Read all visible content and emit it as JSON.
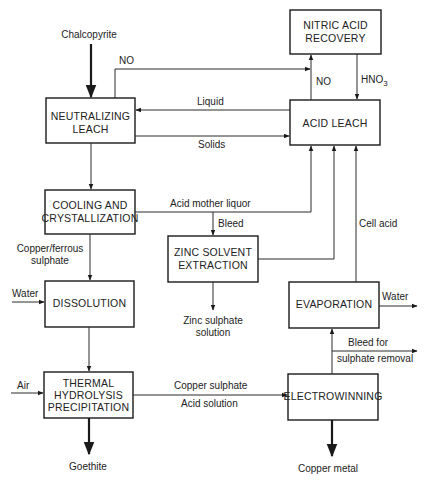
{
  "diagram": {
    "type": "process-flowsheet",
    "units": {
      "nitric_acid_recovery": [
        "NITRIC ACID",
        "RECOVERY"
      ],
      "neutralizing_leach": [
        "NEUTRALIZING",
        "LEACH"
      ],
      "acid_leach": [
        "ACID LEACH"
      ],
      "cooling_crystallization": [
        "COOLING AND",
        "CRYSTALLIZATION"
      ],
      "zinc_solvent_extraction": [
        "ZINC SOLVENT",
        "EXTRACTION"
      ],
      "dissolution": [
        "DISSOLUTION"
      ],
      "evaporation": [
        "EVAPORATION"
      ],
      "thermal_hydrolysis": [
        "THERMAL",
        "HYDROLYSIS",
        "PRECIPITATION"
      ],
      "electrowinning": [
        "ELECTROWINNING"
      ]
    },
    "streams": {
      "chalcopyrite": "Chalcopyrite",
      "no_top": "NO",
      "no_up": "NO",
      "hno3": "HNO",
      "hno3_sub": "3",
      "liquid": "Liquid",
      "solids": "Solids",
      "acid_mother_liquor": "Acid mother liquor",
      "bleed": "Bleed",
      "cell_acid": "Cell acid",
      "copper_ferrous": [
        "Copper/ferrous",
        "sulphate"
      ],
      "water_in": "Water",
      "zinc_sulphate": [
        "Zinc sulphate",
        "solution"
      ],
      "water_out": "Water",
      "bleed_sulphate": [
        "Bleed  for",
        "sulphate removal"
      ],
      "air": "Air",
      "copper_sulphate": "Copper sulphate",
      "acid_solution": "Acid solution",
      "goethite": "Goethite",
      "copper_metal": "Copper metal"
    }
  }
}
